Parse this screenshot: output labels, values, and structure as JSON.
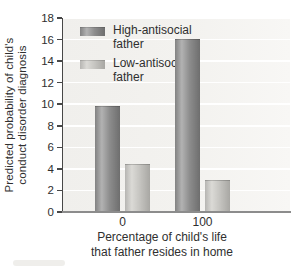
{
  "figure": {
    "background": "#ffffff",
    "plot_bg": "#f2f1ee",
    "grid_color": "#ffffff",
    "yaxis_color": "#474747",
    "xaxis_color": "#8c8c8c",
    "text_color": "#2f2f2f"
  },
  "chart_data": {
    "type": "bar",
    "title": "",
    "xlabel_lines": [
      "Percentage of child's life",
      "that father resides in home"
    ],
    "ylabel_lines": [
      "Predicted probability of child's",
      "conduct disorder diagnosis"
    ],
    "categories": [
      "0",
      "100"
    ],
    "series": [
      {
        "name": "High-antisocial father",
        "values": [
          9.7,
          16.0
        ],
        "color_edge_left": "#828282",
        "color_highlight": "#b2b2b2",
        "color_body": "#8d8d8d",
        "color_edge_right": "#6e6e6e"
      },
      {
        "name": "Low-antisocial father",
        "values": [
          4.4,
          2.9
        ],
        "color_edge_left": "#b6b5b2",
        "color_highlight": "#dbdad6",
        "color_body": "#c6c5c1",
        "color_edge_right": "#a8a7a3"
      }
    ],
    "ylim": [
      0,
      18
    ],
    "yticks": [
      0,
      2,
      4,
      6,
      8,
      10,
      12,
      14,
      16,
      18
    ],
    "grid": true,
    "legend_position": "top-left"
  }
}
